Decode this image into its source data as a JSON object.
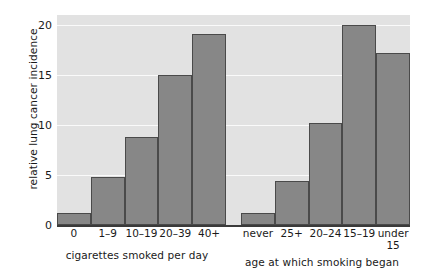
{
  "chart_data": {
    "type": "bar",
    "title": "",
    "ylabel": "relative lung cancer incidence",
    "xlabel": "",
    "ylim": [
      0,
      21
    ],
    "yticks": [
      0,
      5,
      10,
      15,
      20
    ],
    "ytick_labels": [
      "0",
      "5",
      "10",
      "15",
      "20"
    ],
    "grid": true,
    "legend": false,
    "groups": [
      {
        "name": "cigarettes smoked per day",
        "xlabel": "cigarettes smoked per day",
        "categories": [
          "0",
          "1–9",
          "10–19",
          "20–39",
          "40+"
        ],
        "values": [
          1.2,
          4.8,
          8.8,
          15.0,
          19.1
        ]
      },
      {
        "name": "age at which smoking began",
        "xlabel": "age at which smoking began",
        "categories": [
          "never",
          "25+",
          "20–24",
          "15–19",
          "under\n15"
        ],
        "values": [
          1.2,
          4.4,
          10.2,
          20.0,
          17.2
        ]
      }
    ],
    "colors": {
      "bar_fill": "#878787",
      "bar_edge": "#4a4a4a",
      "plot_background": "#e2e2e2",
      "gridline": "#fafafa",
      "axis": "#3a3a3a",
      "text": "#1a1a1a",
      "figure_background": "#ffffff"
    }
  }
}
